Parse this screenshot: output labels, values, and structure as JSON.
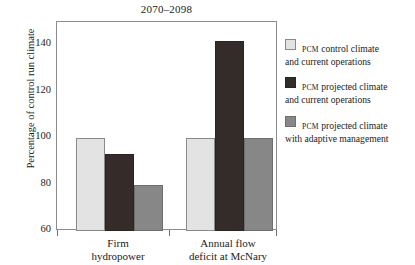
{
  "chart_data": {
    "type": "bar",
    "title": "2070–2098",
    "xlabel": "",
    "ylabel": "Percentage of control run climate",
    "ylim": [
      60,
      150
    ],
    "yticks": [
      60,
      80,
      100,
      120,
      140
    ],
    "ytick_labels": [
      "60",
      "80",
      "100",
      "120",
      "140"
    ],
    "grid": false,
    "legend_position": "right",
    "categories": [
      "Firm hydropower",
      "Annual flow deficit at McNary"
    ],
    "category_lines": [
      [
        "Firm",
        "hydropower"
      ],
      [
        "Annual flow",
        "deficit at McNary"
      ]
    ],
    "series": [
      {
        "name": "PCM control climate and current operations",
        "name_prefix": "PCM",
        "name_line1": " control climate",
        "name_line2": "and current operations",
        "color": "#e3e3e3",
        "values": [
          100,
          100
        ]
      },
      {
        "name": "PCM projected climate and current operations",
        "name_prefix": "PCM",
        "name_line1": " projected climate",
        "name_line2": "and current operations",
        "color": "#332c29",
        "values": [
          93,
          142
        ]
      },
      {
        "name": "PCM projected climate with adaptive management",
        "name_prefix": "PCM",
        "name_line1": " projected climate",
        "name_line2": "with adaptive management",
        "color": "#878787",
        "values": [
          80,
          100
        ]
      }
    ]
  },
  "colors": {
    "axis": "#8c8c8c",
    "tick": "#6f6f6f",
    "text": "#1b1b1b",
    "background": "#ffffff"
  }
}
